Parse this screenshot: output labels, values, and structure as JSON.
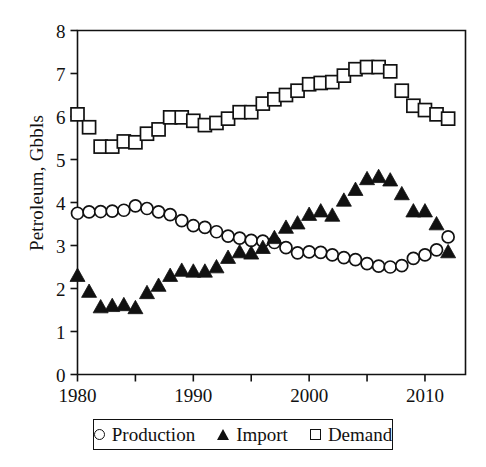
{
  "chart_data": {
    "type": "scatter",
    "title": "",
    "xlabel": "",
    "ylabel": "Petroleum, Gbbls",
    "xlim": [
      1980,
      2013.5
    ],
    "ylim": [
      0,
      8
    ],
    "grid": false,
    "legend_position": "below-axes",
    "xticks": [
      1980,
      1985,
      1990,
      1995,
      2000,
      2005,
      2010
    ],
    "xticklabels": [
      "1980",
      "",
      "1990",
      "",
      "2000",
      "",
      "2010"
    ],
    "yticks": [
      0,
      1,
      2,
      3,
      4,
      5,
      6,
      7,
      8
    ],
    "yticklabels": [
      "0",
      "1",
      "2",
      "3",
      "4",
      "5",
      "6",
      "7",
      "8"
    ],
    "x": [
      1980,
      1981,
      1982,
      1983,
      1984,
      1985,
      1986,
      1987,
      1988,
      1989,
      1990,
      1991,
      1992,
      1993,
      1994,
      1995,
      1996,
      1997,
      1998,
      1999,
      2000,
      2001,
      2002,
      2003,
      2004,
      2005,
      2006,
      2007,
      2008,
      2009,
      2010,
      2011,
      2012
    ],
    "series": [
      {
        "name": "Production",
        "marker": "open-circle",
        "values": [
          3.75,
          3.78,
          3.79,
          3.8,
          3.82,
          3.92,
          3.86,
          3.78,
          3.72,
          3.58,
          3.46,
          3.42,
          3.32,
          3.22,
          3.17,
          3.12,
          3.1,
          3.07,
          2.95,
          2.83,
          2.85,
          2.84,
          2.78,
          2.72,
          2.67,
          2.58,
          2.52,
          2.5,
          2.53,
          2.7,
          2.78,
          2.9,
          3.2
        ]
      },
      {
        "name": "Import",
        "marker": "filled-triangle",
        "values": [
          2.3,
          1.93,
          1.57,
          1.6,
          1.62,
          1.55,
          1.9,
          2.07,
          2.3,
          2.42,
          2.4,
          2.4,
          2.5,
          2.72,
          2.85,
          2.82,
          2.95,
          3.18,
          3.42,
          3.52,
          3.72,
          3.8,
          3.7,
          4.05,
          4.3,
          4.55,
          4.6,
          4.52,
          4.2,
          3.8,
          3.8,
          3.5,
          2.85
        ]
      },
      {
        "name": "Demand",
        "marker": "open-square",
        "values": [
          6.05,
          5.75,
          5.3,
          5.3,
          5.42,
          5.4,
          5.6,
          5.7,
          5.98,
          5.98,
          5.9,
          5.8,
          5.85,
          5.95,
          6.1,
          6.1,
          6.3,
          6.4,
          6.5,
          6.6,
          6.75,
          6.78,
          6.8,
          6.95,
          7.1,
          7.15,
          7.15,
          7.05,
          6.6,
          6.25,
          6.15,
          6.05,
          5.95
        ]
      }
    ]
  },
  "legend": {
    "entries": [
      {
        "label": "Production",
        "symbol": "open-circle"
      },
      {
        "label": "Import",
        "symbol": "filled-triangle"
      },
      {
        "label": "Demand",
        "symbol": "open-square"
      }
    ]
  }
}
